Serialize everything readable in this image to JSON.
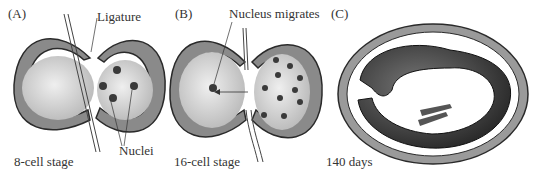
{
  "figure": {
    "panels": [
      {
        "id": "A",
        "letter": "(A)",
        "caption": "8-cell stage",
        "labels": {
          "ligature": "Ligature",
          "nuclei": "Nuclei"
        }
      },
      {
        "id": "B",
        "letter": "(B)",
        "caption": "16-cell stage",
        "labels": {
          "nucleus_migrates": "Nucleus migrates"
        }
      },
      {
        "id": "C",
        "letter": "(C)",
        "caption": "140 days"
      }
    ],
    "colors": {
      "membrane_fill": "#8a8a8a",
      "membrane_stroke": "#2a2a2a",
      "cytoplasm": "#d8d8d8",
      "nucleus": "#3a3a3a",
      "embryo": "#3c3c3c",
      "background": "#ffffff"
    }
  }
}
